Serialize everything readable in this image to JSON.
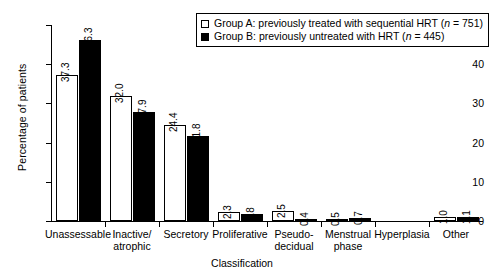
{
  "chart_data": {
    "type": "bar",
    "title": "",
    "xlabel": "Classification",
    "ylabel": "Percentage of patients",
    "ylim": [
      0,
      50
    ],
    "yticks": [
      0,
      10,
      20,
      30,
      40,
      50
    ],
    "grid": false,
    "legend_position": "top-right",
    "categories": [
      "Unassessable",
      "Inactive/\natrophic",
      "Secretory",
      "Proliferative",
      "Pseudo-\ndecidual",
      "Menstrual\nphase",
      "Hyperplasia",
      "Other"
    ],
    "series": [
      {
        "name": "Group A: previously treated with sequential HRT (n = 751)",
        "short_name": "Group A",
        "color": "#ffffff",
        "edge_color": "#000000",
        "n": 751,
        "values": [
          37.3,
          32.0,
          24.4,
          2.3,
          2.5,
          0.5,
          0.0,
          1.0
        ],
        "labels": [
          "37.3",
          "32.0",
          "24.4",
          "2.3",
          "2.5",
          "0.5",
          "",
          "1.0"
        ]
      },
      {
        "name": "Group B: previously untreated with HRT (n = 445)",
        "short_name": "Group B",
        "color": "#000000",
        "edge_color": "#000000",
        "n": 445,
        "values": [
          46.3,
          27.9,
          21.8,
          1.8,
          0.4,
          0.7,
          0.0,
          1.1
        ],
        "labels": [
          "46.3",
          "27.9",
          "21.8",
          "1.8",
          "0.4",
          "0.7",
          "",
          "1.1"
        ]
      }
    ]
  },
  "legend": {
    "items": [
      {
        "swatch": "white",
        "text_before": "Group A: previously treated with sequential HRT (",
        "italic": "n",
        "text_after": " = 751)"
      },
      {
        "swatch": "black",
        "text_before": "Group B: previously untreated with HRT (",
        "italic": "n",
        "text_after": " = 445)"
      }
    ]
  }
}
